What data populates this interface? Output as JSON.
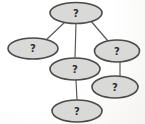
{
  "diagram": {
    "background": "#fdfdfc",
    "node_fill": "#d9d9d7",
    "node_stroke": "#4a4a48",
    "edge_color": "#5a5a58",
    "label_color": "#2e2e2c",
    "label_font_size": 10,
    "node_stroke_width": 1.6,
    "edge_stroke_width": 1.2,
    "nodes": [
      {
        "id": "root",
        "label": "?",
        "cx": 76,
        "cy": 13,
        "rx": 26,
        "ry": 10.5
      },
      {
        "id": "left",
        "label": "?",
        "cx": 33,
        "cy": 48.5,
        "rx": 25,
        "ry": 10.5
      },
      {
        "id": "right",
        "label": "?",
        "cx": 117,
        "cy": 51,
        "rx": 22.5,
        "ry": 11
      },
      {
        "id": "middle",
        "label": "?",
        "cx": 75,
        "cy": 69,
        "rx": 25,
        "ry": 11
      },
      {
        "id": "bottom-right",
        "label": "?",
        "cx": 115,
        "cy": 87,
        "rx": 23,
        "ry": 11
      },
      {
        "id": "bottom",
        "label": "?",
        "cx": 77,
        "cy": 111,
        "rx": 25,
        "ry": 11
      }
    ],
    "edges": [
      {
        "from": "root",
        "to": "left",
        "x1": 65,
        "y1": 22,
        "x2": 45,
        "y2": 41
      },
      {
        "from": "root",
        "to": "middle",
        "x1": 76,
        "y1": 23,
        "x2": 75,
        "y2": 58
      },
      {
        "from": "root",
        "to": "right",
        "x1": 90,
        "y1": 20,
        "x2": 108,
        "y2": 41
      },
      {
        "from": "middle",
        "to": "bottom",
        "x1": 76,
        "y1": 80,
        "x2": 77,
        "y2": 100
      },
      {
        "from": "right",
        "to": "bottom-right",
        "x1": 120,
        "y1": 62,
        "x2": 120,
        "y2": 77
      }
    ]
  }
}
